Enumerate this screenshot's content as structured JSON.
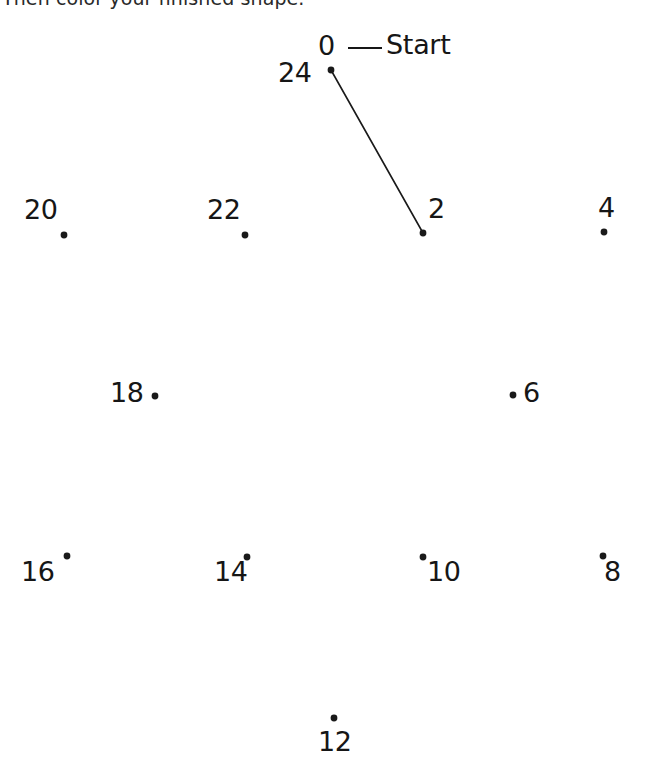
{
  "page": {
    "background_color": "#ffffff",
    "ink_color": "#161616",
    "width": 648,
    "height": 774
  },
  "instruction": {
    "text": "Then color your finished shape.",
    "clipped": "true"
  },
  "start_marker": {
    "label": "Start",
    "dash_from_x": 348,
    "dash_to_x": 382,
    "dash_y": 48
  },
  "drawn_segment": {
    "from_label": "0",
    "to_label": "2",
    "x1": 331,
    "y1": 70,
    "x2": 423,
    "y2": 233,
    "stroke_color": "#1a1a1a",
    "stroke_width": 1.6
  },
  "dots": [
    {
      "label": "0",
      "dot_x": 331,
      "dot_y": 70,
      "label_x": 318,
      "label_y": 32,
      "anchor": "above-left"
    },
    {
      "label": "24",
      "dot_x": 331,
      "dot_y": 70,
      "label_x": 278,
      "label_y": 59,
      "anchor": "left"
    },
    {
      "label": "2",
      "dot_x": 423,
      "dot_y": 233,
      "label_x": 428,
      "label_y": 195,
      "anchor": "above-right"
    },
    {
      "label": "4",
      "dot_x": 604,
      "dot_y": 232,
      "label_x": 598,
      "label_y": 194,
      "anchor": "above"
    },
    {
      "label": "6",
      "dot_x": 513,
      "dot_y": 395,
      "label_x": 523,
      "label_y": 379,
      "anchor": "right"
    },
    {
      "label": "8",
      "dot_x": 603,
      "dot_y": 556,
      "label_x": 604,
      "label_y": 558,
      "anchor": "below"
    },
    {
      "label": "10",
      "dot_x": 423,
      "dot_y": 557,
      "label_x": 427,
      "label_y": 558,
      "anchor": "below-right"
    },
    {
      "label": "12",
      "dot_x": 334,
      "dot_y": 718,
      "label_x": 318,
      "label_y": 728,
      "anchor": "below"
    },
    {
      "label": "14",
      "dot_x": 247,
      "dot_y": 557,
      "label_x": 214,
      "label_y": 558,
      "anchor": "below-left"
    },
    {
      "label": "16",
      "dot_x": 67,
      "dot_y": 556,
      "label_x": 21,
      "label_y": 558,
      "anchor": "below-left"
    },
    {
      "label": "18",
      "dot_x": 155,
      "dot_y": 396,
      "label_x": 110,
      "label_y": 379,
      "anchor": "left"
    },
    {
      "label": "20",
      "dot_x": 64,
      "dot_y": 235,
      "label_x": 24,
      "label_y": 196,
      "anchor": "above-left"
    },
    {
      "label": "22",
      "dot_x": 245,
      "dot_y": 235,
      "label_x": 207,
      "label_y": 196,
      "anchor": "above-left"
    }
  ],
  "dot_style": {
    "radius": 3.4,
    "color": "#1a1a1a"
  }
}
